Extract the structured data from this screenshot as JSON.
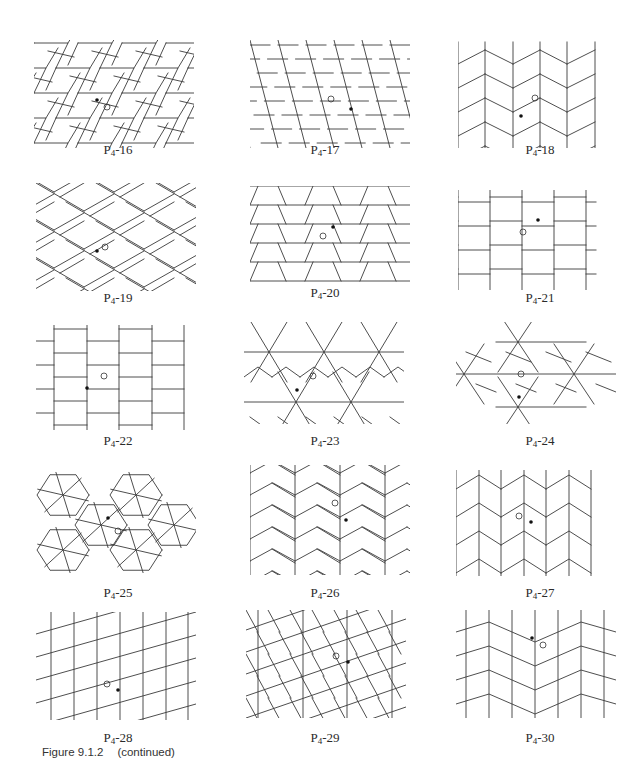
{
  "figure": {
    "caption_number": "Figure 9.1.2",
    "caption_note": "(continued)"
  },
  "panels": [
    {
      "id": "P4-16",
      "label_main": "P",
      "label_sub": "4",
      "label_num": "-16",
      "x": 34,
      "y": 40,
      "w": 160,
      "h": 108,
      "lx": 118,
      "ly": 147,
      "kind": "herring16",
      "dot": [
        97,
        100
      ],
      "ring": [
        107,
        107
      ]
    },
    {
      "id": "P4-17",
      "label_main": "P",
      "label_sub": "4",
      "label_num": "-17",
      "x": 250,
      "y": 40,
      "w": 160,
      "h": 108,
      "lx": 325,
      "ly": 147,
      "kind": "rhomb17",
      "dot": [
        351,
        109
      ],
      "ring": [
        331,
        99
      ]
    },
    {
      "id": "P4-18",
      "label_main": "P",
      "label_sub": "4",
      "label_num": "-18",
      "x": 458,
      "y": 40,
      "w": 160,
      "h": 108,
      "lx": 540,
      "ly": 147,
      "kind": "zig18",
      "dot": [
        521,
        116
      ],
      "ring": [
        535,
        98
      ]
    },
    {
      "id": "P4-19",
      "label_main": "P",
      "label_sub": "4",
      "label_num": "-19",
      "x": 36,
      "y": 183,
      "w": 160,
      "h": 108,
      "lx": 118,
      "ly": 295,
      "kind": "herring19",
      "dot": [
        97,
        251
      ],
      "ring": [
        105,
        247
      ]
    },
    {
      "id": "P4-20",
      "label_main": "P",
      "label_sub": "4",
      "label_num": "-20",
      "x": 250,
      "y": 186,
      "w": 160,
      "h": 106,
      "lx": 325,
      "ly": 290,
      "kind": "trap20",
      "dot": [
        333,
        227
      ],
      "ring": [
        323,
        236
      ]
    },
    {
      "id": "P4-21",
      "label_main": "P",
      "label_sub": "4",
      "label_num": "-21",
      "x": 458,
      "y": 190,
      "w": 160,
      "h": 100,
      "lx": 540,
      "ly": 295,
      "kind": "brick21",
      "dot": [
        538,
        220
      ],
      "ring": [
        523,
        232
      ]
    },
    {
      "id": "P4-22",
      "label_main": "P",
      "label_sub": "4",
      "label_num": "-22",
      "x": 36,
      "y": 325,
      "w": 160,
      "h": 105,
      "lx": 118,
      "ly": 438,
      "kind": "brick22",
      "dot": [
        87,
        388
      ],
      "ring": [
        104,
        376
      ]
    },
    {
      "id": "P4-23",
      "label_main": "P",
      "label_sub": "4",
      "label_num": "-23",
      "x": 244,
      "y": 322,
      "w": 160,
      "h": 102,
      "lx": 325,
      "ly": 438,
      "kind": "star23",
      "dot": [
        297,
        390
      ],
      "ring": [
        313,
        376
      ]
    },
    {
      "id": "P4-24",
      "label_main": "P",
      "label_sub": "4",
      "label_num": "-24",
      "x": 456,
      "y": 322,
      "w": 160,
      "h": 102,
      "lx": 540,
      "ly": 438,
      "kind": "star24",
      "dot": [
        519,
        397
      ],
      "ring": [
        521,
        374
      ]
    },
    {
      "id": "P4-25",
      "label_main": "P",
      "label_sub": "4",
      "label_num": "-25",
      "x": 36,
      "y": 465,
      "w": 160,
      "h": 110,
      "lx": 118,
      "ly": 590,
      "kind": "hex25",
      "dot": [
        108,
        518
      ],
      "ring": [
        118,
        531
      ]
    },
    {
      "id": "P4-26",
      "label_main": "P",
      "label_sub": "4",
      "label_num": "-26",
      "x": 250,
      "y": 465,
      "w": 160,
      "h": 110,
      "lx": 325,
      "ly": 590,
      "kind": "chev26",
      "dot": [
        346,
        520
      ],
      "ring": [
        335,
        503
      ]
    },
    {
      "id": "P4-27",
      "label_main": "P",
      "label_sub": "4",
      "label_num": "-27",
      "x": 456,
      "y": 470,
      "w": 160,
      "h": 106,
      "lx": 540,
      "ly": 590,
      "kind": "chev27",
      "dot": [
        531,
        522
      ],
      "ring": [
        519,
        516
      ]
    },
    {
      "id": "P4-28",
      "label_main": "P",
      "label_sub": "4",
      "label_num": "-28",
      "x": 36,
      "y": 612,
      "w": 160,
      "h": 108,
      "lx": 118,
      "ly": 735,
      "kind": "para28",
      "dot": [
        118,
        690
      ],
      "ring": [
        107,
        684
      ]
    },
    {
      "id": "P4-29",
      "label_main": "P",
      "label_sub": "4",
      "label_num": "-29",
      "x": 246,
      "y": 610,
      "w": 160,
      "h": 108,
      "lx": 325,
      "ly": 735,
      "kind": "brick29",
      "dot": [
        348,
        662
      ],
      "ring": [
        336,
        656
      ]
    },
    {
      "id": "P4-30",
      "label_main": "P",
      "label_sub": "4",
      "label_num": "-30",
      "x": 456,
      "y": 610,
      "w": 160,
      "h": 108,
      "lx": 540,
      "ly": 735,
      "kind": "chev30",
      "dot": [
        532,
        638
      ],
      "ring": [
        543,
        645
      ]
    }
  ]
}
